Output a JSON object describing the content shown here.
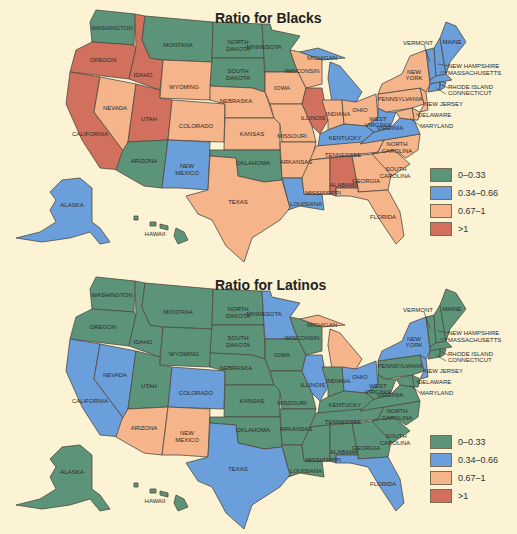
{
  "colors": {
    "c0": "#5b9478",
    "c1": "#6a9fdb",
    "c2": "#f6b48a",
    "c3": "#d0705d",
    "background": "#fbf3d3"
  },
  "legend": [
    {
      "key": "c0",
      "label": "0–0.33"
    },
    {
      "key": "c1",
      "label": "0.34–0.66"
    },
    {
      "key": "c2",
      "label": "0.67–1"
    },
    {
      "key": "c3",
      "label": ">1"
    }
  ],
  "maps": [
    {
      "title": "Ratio for Blacks",
      "states": {
        "WASHINGTON": "c0",
        "OREGON": "c3",
        "CALIFORNIA": "c3",
        "IDAHO": "c3",
        "NEVADA": "c2",
        "UTAH": "c3",
        "ARIZONA": "c0",
        "MONTANA": "c0",
        "WYOMING": "c2",
        "COLORADO": "c2",
        "NEW MEXICO": "c1",
        "NORTH DAKOTA": "c0",
        "SOUTH DAKOTA": "c0",
        "NEBRASKA": "c2",
        "KANSAS": "c2",
        "OKLAHOMA": "c0",
        "TEXAS": "c2",
        "MINNESOTA": "c0",
        "IOWA": "c2",
        "MISSOURI": "c2",
        "ARKANSAS": "c2",
        "LOUISIANA": "c1",
        "WISCONSIN": "c2",
        "ILLINOIS": "c3",
        "MICHIGAN": "c1",
        "INDIANA": "c2",
        "OHIO": "c2",
        "KENTUCKY": "c1",
        "TENNESSEE": "c2",
        "MISSISSIPPI": "c2",
        "ALABAMA": "c3",
        "GEORGIA": "c2",
        "FLORIDA": "c2",
        "SOUTH CAROLINA": "c2",
        "NORTH CAROLINA": "c2",
        "VIRGINIA": "c1",
        "WEST VIRGINIA": "c1",
        "PENNSYLVANIA": "c2",
        "NEW YORK": "c2",
        "NEW JERSEY": "c2",
        "DELAWARE": "c2",
        "MARYLAND": "c2",
        "VERMONT": "c1",
        "NEW HAMPSHIRE": "c1",
        "MAINE": "c1",
        "MASSACHUSETTS": "c1",
        "RHODE ISLAND": "c1",
        "CONNECTICUT": "c1",
        "ALASKA": "c1",
        "HAWAII": "c0"
      }
    },
    {
      "title": "Ratio for Latinos",
      "states": {
        "WASHINGTON": "c0",
        "OREGON": "c0",
        "CALIFORNIA": "c1",
        "IDAHO": "c0",
        "NEVADA": "c1",
        "UTAH": "c0",
        "ARIZONA": "c2",
        "MONTANA": "c0",
        "WYOMING": "c0",
        "COLORADO": "c1",
        "NEW MEXICO": "c2",
        "NORTH DAKOTA": "c0",
        "SOUTH DAKOTA": "c0",
        "NEBRASKA": "c0",
        "KANSAS": "c0",
        "OKLAHOMA": "c0",
        "TEXAS": "c1",
        "MINNESOTA": "c1",
        "IOWA": "c0",
        "MISSOURI": "c0",
        "ARKANSAS": "c0",
        "LOUISIANA": "c0",
        "WISCONSIN": "c0",
        "ILLINOIS": "c1",
        "MICHIGAN": "c2",
        "INDIANA": "c0",
        "OHIO": "c1",
        "KENTUCKY": "c0",
        "TENNESSEE": "c0",
        "MISSISSIPPI": "c0",
        "ALABAMA": "c0",
        "GEORGIA": "c0",
        "FLORIDA": "c1",
        "SOUTH CAROLINA": "c0",
        "NORTH CAROLINA": "c0",
        "VIRGINIA": "c0",
        "WEST VIRGINIA": "c0",
        "PENNSYLVANIA": "c0",
        "NEW YORK": "c1",
        "NEW JERSEY": "c1",
        "DELAWARE": "c0",
        "MARYLAND": "c0",
        "VERMONT": "c0",
        "NEW HAMPSHIRE": "c0",
        "MAINE": "c0",
        "MASSACHUSETTS": "c0",
        "RHODE ISLAND": "c0",
        "CONNECTICUT": "c0",
        "ALASKA": "c0",
        "HAWAII": "c0"
      }
    }
  ],
  "labels": {
    "WASHINGTON": "WASHINGTON",
    "OREGON": "OREGON",
    "CALIFORNIA": "CALIFORNIA",
    "IDAHO": "IDAHO",
    "NEVADA": "NEVADA",
    "UTAH": "UTAH",
    "ARIZONA": "ARIZONA",
    "MONTANA": "MONTANA",
    "WYOMING": "WYOMING",
    "COLORADO": "COLORADO",
    "NEW_1": "NEW",
    "MEXICO": "MEXICO",
    "NORTH_1": "NORTH",
    "DAKOTA": "DAKOTA",
    "SOUTH_1": "SOUTH",
    "NEBRASKA": "NEBRASKA",
    "KANSAS": "KANSAS",
    "OKLAHOMA": "OKLAHOMA",
    "TEXAS": "TEXAS",
    "MINNESOTA": "MINNESOTA",
    "IOWA": "IOWA",
    "MISSOURI": "MISSOURI",
    "ARKANSAS": "ARKANSAS",
    "LOUISIANA": "LOUISIANA",
    "WISCONSIN": "WISCONSIN",
    "ILLINOIS": "ILLINOIS",
    "MICHIGAN": "MICHIGAN",
    "INDIANA": "INDIANA",
    "OHIO": "OHIO",
    "KENTUCKY": "KENTUCKY",
    "TENNESSEE": "TENNESSEE",
    "MISSISSIPPI": "MISSISSIPPI",
    "ALABAMA": "ALABAMA",
    "GEORGIA": "GEORGIA",
    "FLORIDA": "FLORIDA",
    "CAROLINA": "CAROLINA",
    "VIRGINIA": "VIRGINIA",
    "WEST": "WEST",
    "PENNSYLVANIA": "PENNSYLVANIA",
    "YORK": "YORK",
    "NEW_JERSEY": "NEW JERSEY",
    "DELAWARE": "DELAWARE",
    "MARYLAND": "MARYLAND",
    "VERMONT": "VERMONT",
    "MAINE": "MAINE",
    "NEW_HAMPSHIRE": "NEW HAMPSHIRE",
    "MASSACHUSETTS": "MASSACHUSETTS",
    "RHODE_ISLAND": "RHODE ISLAND",
    "CONNECTICUT": "CONNECTICUT",
    "ALASKA": "ALASKA",
    "HAWAII": "HAWAII"
  }
}
